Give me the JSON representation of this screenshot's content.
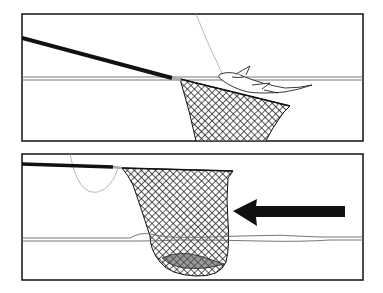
{
  "diagram": {
    "type": "instructional-illustration",
    "panels": [
      {
        "id": "panel-1",
        "description": "Net held at water surface with fish being drawn over the rim",
        "elements": [
          "frame",
          "water-line",
          "landing-net-pole",
          "landing-net",
          "fishing-line",
          "fish"
        ]
      },
      {
        "id": "panel-2",
        "description": "Net lifted with fish inside; arrow shows direction of motion",
        "elements": [
          "frame",
          "water-line",
          "landing-net-pole",
          "landing-net",
          "fishing-line",
          "fish-in-net",
          "direction-arrow"
        ]
      }
    ],
    "arrow": {
      "direction": "left"
    },
    "colors": {
      "ink": "#111111",
      "background": "#ffffff",
      "water": "#777777"
    }
  }
}
